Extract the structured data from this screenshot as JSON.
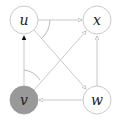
{
  "diagram": {
    "nodes": [
      {
        "id": "u",
        "label": "u",
        "x": 24,
        "y": 20,
        "filled": false
      },
      {
        "id": "x",
        "label": "x",
        "x": 97,
        "y": 20,
        "filled": false
      },
      {
        "id": "v",
        "label": "v",
        "x": 24,
        "y": 100,
        "filled": true
      },
      {
        "id": "w",
        "label": "w",
        "x": 97,
        "y": 100,
        "filled": false
      }
    ],
    "edges": [
      {
        "from": "u",
        "to": "x",
        "head": "open"
      },
      {
        "from": "v",
        "to": "u",
        "head": "filled"
      },
      {
        "from": "u",
        "to": "w",
        "head": "open"
      },
      {
        "from": "v",
        "to": "x",
        "head": "open"
      },
      {
        "from": "w",
        "to": "v",
        "head": "open"
      },
      {
        "from": "w",
        "to": "x",
        "head": "open"
      }
    ],
    "angle_marks": [
      "at-u-between-ux-and-uw",
      "at-v-between-vu-and-vx"
    ],
    "colors": {
      "node_stroke": "#bbbbbb",
      "edge": "#bbbbbb",
      "filled_node": "#999999",
      "label": "#222222"
    }
  }
}
